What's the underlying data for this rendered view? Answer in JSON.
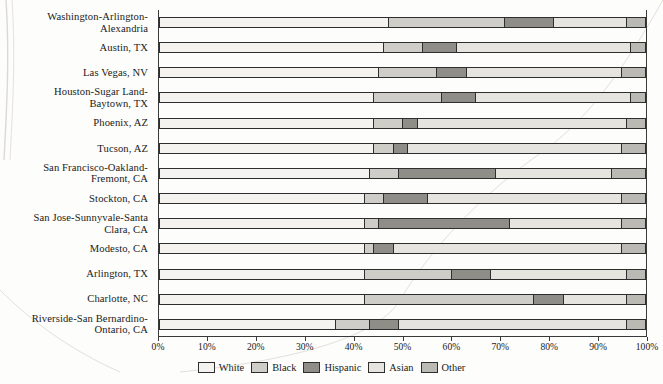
{
  "chart_data": {
    "type": "bar",
    "orientation": "horizontal",
    "stacked": true,
    "title": "",
    "xlabel": "",
    "ylabel": "",
    "xlim": [
      0,
      100
    ],
    "grid": false,
    "legend_position": "bottom",
    "xticks": [
      "0%",
      "10%",
      "20%",
      "30%",
      "40%",
      "50%",
      "60%",
      "70%",
      "80%",
      "90%",
      "100%"
    ],
    "xtick_values": [
      0,
      10,
      20,
      30,
      40,
      50,
      60,
      70,
      80,
      90,
      100
    ],
    "categories": [
      "Washington-Arlington-Alexandria",
      "Austin, TX",
      "Las Vegas, NV",
      "Houston-Sugar Land-Baytown, TX",
      "Phoenix, AZ",
      "Tucson, AZ",
      "San Francisco-Oakland-Fremont, CA",
      "Stockton, CA",
      "San Jose-Sunnyvale-Santa Clara, CA",
      "Modesto, CA",
      "Arlington, TX",
      "Charlotte, NC",
      "Riverside-San Bernardino-Ontario, CA"
    ],
    "category_lines": [
      [
        "Washington-Arlington-",
        "Alexandria"
      ],
      [
        "Austin, TX"
      ],
      [
        "Las Vegas, NV"
      ],
      [
        "Houston-Sugar Land-",
        "Baytown, TX"
      ],
      [
        "Phoenix, AZ"
      ],
      [
        "Tucson, AZ"
      ],
      [
        "San Francisco-Oakland-",
        "Fremont, CA"
      ],
      [
        "Stockton, CA"
      ],
      [
        "San Jose-Sunnyvale-Santa",
        "Clara, CA"
      ],
      [
        "Modesto, CA"
      ],
      [
        "Arlington, TX"
      ],
      [
        "Charlotte, NC"
      ],
      [
        "Riverside-San Bernardino-",
        "Ontario, CA"
      ]
    ],
    "series": [
      {
        "name": "White",
        "color": "#f4f3f0",
        "values": [
          47,
          46,
          45,
          44,
          44,
          44,
          43,
          42,
          42,
          42,
          42,
          42,
          36
        ]
      },
      {
        "name": "Black",
        "color": "#cfcdc8",
        "values": [
          24,
          8,
          12,
          14,
          6,
          4,
          6,
          4,
          3,
          2,
          18,
          35,
          7
        ]
      },
      {
        "name": "Hispanic",
        "color": "#8f8d88",
        "values": [
          10,
          7,
          6,
          7,
          3,
          3,
          20,
          9,
          27,
          4,
          8,
          6,
          6
        ]
      },
      {
        "name": "Asian",
        "color": "#e6e4df",
        "values": [
          15,
          36,
          32,
          32,
          43,
          44,
          24,
          40,
          23,
          47,
          28,
          13,
          47
        ]
      },
      {
        "name": "Other",
        "color": "#bbb9b4",
        "values": [
          4,
          3,
          5,
          3,
          4,
          5,
          7,
          5,
          5,
          5,
          4,
          4,
          4
        ]
      }
    ]
  },
  "legend": {
    "items": [
      {
        "label": "White"
      },
      {
        "label": "Black"
      },
      {
        "label": "Hispanic"
      },
      {
        "label": "Asian"
      },
      {
        "label": "Other"
      }
    ]
  }
}
